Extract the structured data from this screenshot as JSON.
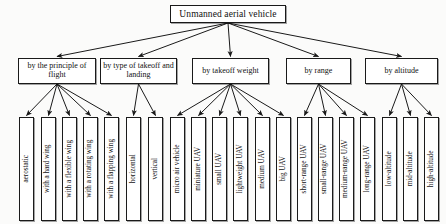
{
  "diagram": {
    "type": "tree",
    "root": {
      "label": "Unmanned aerial vehicle"
    },
    "categories": [
      {
        "id": "principle-of-flight",
        "label": "by the principle of flight"
      },
      {
        "id": "type-of-takeoff-and-landing",
        "label": "by type of takeoff and landing"
      },
      {
        "id": "takeoff-weight",
        "label": "by takeoff weight"
      },
      {
        "id": "range",
        "label": "by range"
      },
      {
        "id": "altitude",
        "label": "by altitude"
      }
    ],
    "leaves": [
      {
        "id": "aerostatic",
        "label": "aerostatic",
        "parent": "principle-of-flight"
      },
      {
        "id": "with-a-hard-wing",
        "label": "with a hard wing",
        "parent": "principle-of-flight"
      },
      {
        "id": "with-a-flexible-wing",
        "label": "with a flexible wing",
        "parent": "principle-of-flight"
      },
      {
        "id": "with-a-rotating-wing",
        "label": "with a rotating wing",
        "parent": "principle-of-flight"
      },
      {
        "id": "with-a-flapping-wing",
        "label": "with a flapping wing",
        "parent": "principle-of-flight"
      },
      {
        "id": "horizontal",
        "label": "horizontal",
        "parent": "type-of-takeoff-and-landing"
      },
      {
        "id": "vertical",
        "label": "vertical",
        "parent": "type-of-takeoff-and-landing"
      },
      {
        "id": "micro-air-vehicle",
        "label": "micro air vehicle",
        "parent": "takeoff-weight"
      },
      {
        "id": "miniature-uav",
        "label": "miniature UAV",
        "parent": "takeoff-weight"
      },
      {
        "id": "small-uav",
        "label": "small UAV",
        "parent": "takeoff-weight"
      },
      {
        "id": "lightweight-uav",
        "label": "lightweight UAV",
        "parent": "takeoff-weight"
      },
      {
        "id": "medium-uav",
        "label": "medium UAV",
        "parent": "takeoff-weight"
      },
      {
        "id": "big-uav",
        "label": "big UAV",
        "parent": "takeoff-weight"
      },
      {
        "id": "short-range-uav",
        "label": "short-range UAV",
        "parent": "range"
      },
      {
        "id": "small-range-uav",
        "label": "small-range UAV",
        "parent": "range"
      },
      {
        "id": "medium-range-uav",
        "label": "medium-range UAV",
        "parent": "range"
      },
      {
        "id": "long-range-uav",
        "label": "long-range UAV",
        "parent": "range"
      },
      {
        "id": "low-altitude",
        "label": "low-altitude",
        "parent": "altitude"
      },
      {
        "id": "mid-altitude",
        "label": "mid-altitude",
        "parent": "altitude"
      },
      {
        "id": "high-altitude",
        "label": "high-altitude",
        "parent": "altitude"
      }
    ],
    "colors": {
      "box_fill": "#ffffff",
      "box_border": "#1a1a1a",
      "edge": "#1a1a1a",
      "background": "#fbfbfa",
      "text": "#111111"
    },
    "layout": {
      "root_box": {
        "x": 170,
        "y": 5,
        "w": 116,
        "h": 18
      },
      "category_boxes": [
        {
          "x": 18,
          "y": 58,
          "w": 78,
          "h": 26
        },
        {
          "x": 100,
          "y": 58,
          "w": 77,
          "h": 26
        },
        {
          "x": 192,
          "y": 58,
          "w": 77,
          "h": 26
        },
        {
          "x": 286,
          "y": 58,
          "w": 65,
          "h": 26
        },
        {
          "x": 365,
          "y": 58,
          "w": 73,
          "h": 26
        }
      ],
      "leaf_y": 117,
      "leaf_h": 104,
      "leaf_w": 15,
      "leaf_x": [
        19,
        41,
        62,
        83,
        104,
        126,
        148,
        170,
        191,
        212,
        233,
        255,
        276,
        297,
        318,
        339,
        360,
        382,
        403,
        424
      ]
    }
  }
}
